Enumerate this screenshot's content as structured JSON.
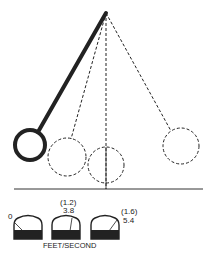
{
  "diagram": {
    "type": "pendulum-swing",
    "pivot": {
      "x": 106,
      "y": 13
    },
    "bobs": [
      {
        "id": "bob-release",
        "style": "solid",
        "cx": 30,
        "cy": 145,
        "r": 15
      },
      {
        "id": "bob-mid",
        "style": "dashed",
        "cx": 67,
        "cy": 157,
        "r": 19
      },
      {
        "id": "bob-bottom",
        "style": "dashed",
        "cx": 106,
        "cy": 165,
        "r": 18
      },
      {
        "id": "bob-far",
        "style": "dashed",
        "cx": 181,
        "cy": 146,
        "r": 18
      }
    ],
    "baseline_y": 189
  },
  "meters": [
    {
      "id": "meter-1",
      "value": "0",
      "secondary": ""
    },
    {
      "id": "meter-2",
      "value": "3.8",
      "secondary": "(1.2)"
    },
    {
      "id": "meter-3",
      "value": "5.4",
      "secondary": "(1.6)"
    }
  ],
  "units_label": "FEET/SECOND",
  "colors": {
    "ink": "#222222",
    "background": "#ffffff"
  }
}
